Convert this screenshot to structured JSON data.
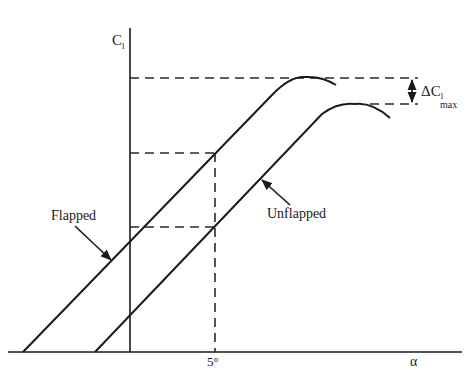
{
  "diagram": {
    "y_axis_label": "C",
    "y_axis_subscript": "l",
    "x_axis_label": "α",
    "x_tick_label": "5°",
    "delta_label": "ΔC",
    "delta_subscript_l": "l",
    "delta_subscript_max": "max",
    "curves": [
      {
        "name": "Flapped",
        "label": "Flapped"
      },
      {
        "name": "Unflapped",
        "label": "Unflapped"
      }
    ],
    "colors": {
      "line": "#1a1a1a",
      "background": "#ffffff"
    }
  }
}
